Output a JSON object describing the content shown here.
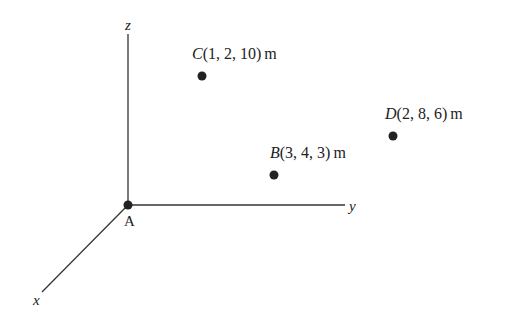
{
  "figure": {
    "origin": {
      "label": "A",
      "x": 128,
      "y": 205
    },
    "axes": {
      "z": {
        "label": "z",
        "x1": 128,
        "y1": 205,
        "x2": 128,
        "y2": 34,
        "label_x": 125,
        "label_y": 30
      },
      "y": {
        "label": "y",
        "x1": 128,
        "y1": 205,
        "x2": 345,
        "y2": 205,
        "label_x": 349,
        "label_y": 211
      },
      "x": {
        "label": "x",
        "x1": 128,
        "y1": 205,
        "x2": 42,
        "y2": 292,
        "label_x": 33,
        "label_y": 305
      }
    },
    "points": [
      {
        "name": "C",
        "coords": "(1, 2, 10)",
        "unit": "m",
        "dot_x": 202,
        "dot_y": 76,
        "label_x": 192,
        "label_y": 59
      },
      {
        "name": "D",
        "coords": "(2, 8, 6)",
        "unit": "m",
        "dot_x": 393,
        "dot_y": 136,
        "label_x": 385,
        "label_y": 119
      },
      {
        "name": "B",
        "coords": "(3, 4, 3)",
        "unit": "m",
        "dot_x": 274,
        "dot_y": 175,
        "label_x": 270,
        "label_y": 158
      }
    ],
    "colors": {
      "ink": "#222222",
      "background": "#ffffff"
    }
  }
}
